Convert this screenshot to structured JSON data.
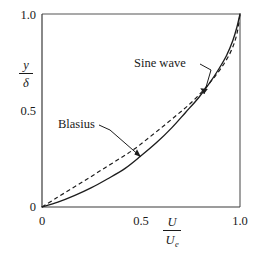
{
  "figure": {
    "name": "boundary-layer-velocity-profile",
    "background_color": "#ffffff",
    "ink_color": "#1d1d1d",
    "frame_color": "#555555"
  },
  "axes": {
    "y_axis": {
      "label_numerator": "y",
      "label_denominator": "δ",
      "ticks": [
        "0",
        "0.5",
        "1.0"
      ],
      "tick_values": [
        0,
        0.5,
        1.0
      ],
      "range": [
        0,
        1.0
      ]
    },
    "x_axis": {
      "label_numerator": "U",
      "label_denominator": "U",
      "label_denominator_subscript": "e",
      "ticks": [
        "0",
        "0.5",
        "1.0"
      ],
      "tick_values": [
        0,
        0.5,
        1.0
      ],
      "range": [
        0,
        1.0
      ]
    }
  },
  "annotations": [
    {
      "id": "sine-wave",
      "label": "Sine wave",
      "target_point": [
        0.845,
        0.625
      ]
    },
    {
      "id": "blasius",
      "label": "Blasius",
      "target_point": [
        0.5,
        0.285
      ]
    }
  ],
  "chart_data": {
    "type": "line",
    "title": "",
    "xlabel": "U/Ue",
    "ylabel": "y/delta",
    "xlim": [
      0,
      1.0
    ],
    "ylim": [
      0,
      1.0
    ],
    "grid": false,
    "legend": "inline-annotations",
    "series": [
      {
        "name": "Blasius",
        "style": "solid",
        "x": [
          0.0,
          0.08,
          0.166,
          0.25,
          0.33,
          0.42,
          0.5,
          0.58,
          0.655,
          0.725,
          0.79,
          0.845,
          0.893,
          0.932,
          0.963,
          0.984,
          1.0
        ],
        "y": [
          0.0,
          0.025,
          0.06,
          0.1,
          0.145,
          0.2,
          0.265,
          0.335,
          0.41,
          0.49,
          0.565,
          0.64,
          0.715,
          0.785,
          0.86,
          0.93,
          1.0
        ]
      },
      {
        "name": "Sine wave",
        "style": "dashed",
        "x": [
          0.0,
          0.078,
          0.157,
          0.236,
          0.313,
          0.391,
          0.466,
          0.541,
          0.614,
          0.685,
          0.753,
          0.819,
          0.876,
          0.924,
          0.96,
          0.985,
          1.0
        ],
        "y": [
          0.0,
          0.05,
          0.1,
          0.15,
          0.2,
          0.25,
          0.3,
          0.36,
          0.42,
          0.48,
          0.54,
          0.61,
          0.68,
          0.75,
          0.82,
          0.9,
          1.0
        ]
      }
    ]
  }
}
